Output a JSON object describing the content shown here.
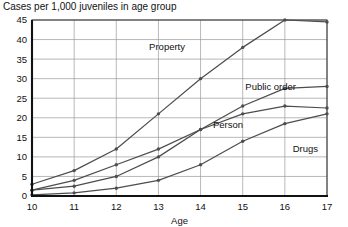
{
  "chart_data": {
    "type": "line",
    "title": "Cases per 1,000 juveniles in age group",
    "xlabel": "Age",
    "ylabel": "",
    "categories": [
      10,
      11,
      12,
      13,
      14,
      15,
      16,
      17
    ],
    "x": [
      10,
      11,
      12,
      13,
      14,
      15,
      16,
      17
    ],
    "xlim": [
      10,
      17
    ],
    "ylim": [
      0,
      45
    ],
    "ytick_labels": [
      "0",
      "5",
      "10",
      "15",
      "20",
      "25",
      "30",
      "35",
      "40",
      "45"
    ],
    "yticks": [
      0,
      5,
      10,
      15,
      20,
      25,
      30,
      35,
      40,
      45
    ],
    "xtick_labels": [
      "10",
      "11",
      "12",
      "13",
      "14",
      "15",
      "16",
      "17"
    ],
    "grid": true,
    "legend": "inline-labels",
    "series": [
      {
        "name": "Property",
        "label": "Property",
        "values": [
          3,
          6.5,
          12,
          21,
          30,
          38,
          45,
          44.5
        ]
      },
      {
        "name": "Public order",
        "label": "Public order",
        "values": [
          1.5,
          4,
          8,
          12,
          17,
          23,
          27.5,
          28
        ]
      },
      {
        "name": "Person",
        "label": "Person",
        "values": [
          1.5,
          2.5,
          5,
          10,
          17,
          21,
          23,
          22.5
        ]
      },
      {
        "name": "Drugs",
        "label": "Drugs",
        "values": [
          0.3,
          0.8,
          2,
          4,
          8,
          14,
          18.5,
          21
        ]
      }
    ],
    "colors": {
      "line": "#4d4d4d",
      "grid": "#9a9a9a",
      "frame": "#3a3a3a",
      "axis": "#111111",
      "text": "#111111",
      "background": "#ffffff"
    },
    "annotations": [
      {
        "text": "Property",
        "series": "Property"
      },
      {
        "text": "Public order",
        "series": "Public order"
      },
      {
        "text": "Person",
        "series": "Person"
      },
      {
        "text": "Drugs",
        "series": "Drugs"
      }
    ]
  }
}
